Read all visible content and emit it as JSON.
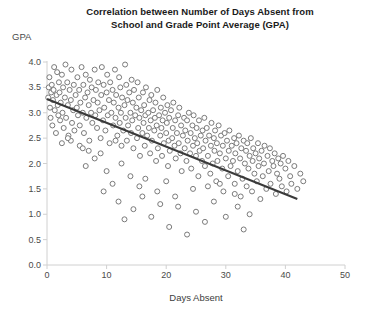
{
  "chart_data": {
    "type": "scatter",
    "title": "Correlation between Number of Days Absent from School and Grade Point Average (GPA)",
    "title_line1": "Correlation between Number of Days Absent from",
    "title_line2": "School and Grade Point Average (GPA)",
    "xlabel": "Days Absent",
    "ylabel": "GPA",
    "xlim": [
      0,
      50
    ],
    "ylim": [
      0.0,
      4.0
    ],
    "xticks": [
      0,
      10,
      20,
      30,
      40,
      50
    ],
    "xtick_labels": [
      "0",
      "10",
      "20",
      "30",
      "40",
      "50"
    ],
    "yticks": [
      0.0,
      0.5,
      1.0,
      1.5,
      2.0,
      2.5,
      3.0,
      3.5,
      4.0
    ],
    "ytick_labels": [
      "0.0",
      "0.5",
      "1.0",
      "1.5",
      "2.0",
      "2.5",
      "3.0",
      "3.5",
      "4.0"
    ],
    "grid": false,
    "legend": false,
    "marker": "open-circle",
    "marker_color": "#7a7a7a",
    "marker_fill": "#ffffff",
    "marker_size": 5,
    "trendline": {
      "label": "linear fit",
      "color": "#3a3a3a",
      "width": 2,
      "x_start": 0,
      "y_start": 3.27,
      "x_end": 42,
      "y_end": 1.3,
      "slope": -0.0469,
      "intercept": 3.27
    },
    "axis_color": "#d0d0d0",
    "points": [
      [
        0.2,
        3.3
      ],
      [
        0.3,
        3.5
      ],
      [
        0.4,
        3.7
      ],
      [
        0.5,
        3.1
      ],
      [
        0.6,
        2.9
      ],
      [
        0.7,
        3.4
      ],
      [
        0.8,
        3.55
      ],
      [
        0.9,
        2.75
      ],
      [
        1.0,
        3.25
      ],
      [
        1.1,
        3.45
      ],
      [
        1.2,
        3.9
      ],
      [
        1.3,
        3.05
      ],
      [
        1.5,
        2.6
      ],
      [
        1.6,
        3.35
      ],
      [
        1.7,
        3.8
      ],
      [
        1.8,
        3.15
      ],
      [
        1.9,
        2.95
      ],
      [
        2.0,
        3.6
      ],
      [
        2.1,
        3.4
      ],
      [
        2.2,
        2.85
      ],
      [
        2.3,
        3.2
      ],
      [
        2.5,
        3.75
      ],
      [
        2.6,
        3.0
      ],
      [
        2.7,
        3.5
      ],
      [
        2.8,
        2.7
      ],
      [
        3.0,
        3.3
      ],
      [
        3.1,
        3.95
      ],
      [
        3.2,
        2.9
      ],
      [
        3.4,
        3.6
      ],
      [
        3.5,
        3.15
      ],
      [
        3.6,
        2.55
      ],
      [
        3.8,
        3.45
      ],
      [
        4.0,
        3.25
      ],
      [
        4.1,
        3.85
      ],
      [
        4.2,
        2.8
      ],
      [
        4.4,
        3.05
      ],
      [
        4.5,
        3.55
      ],
      [
        4.6,
        2.65
      ],
      [
        4.8,
        3.35
      ],
      [
        5.0,
        3.1
      ],
      [
        5.1,
        3.7
      ],
      [
        5.2,
        2.95
      ],
      [
        5.4,
        3.45
      ],
      [
        5.5,
        2.75
      ],
      [
        5.6,
        3.2
      ],
      [
        5.8,
        3.9
      ],
      [
        6.0,
        3.0
      ],
      [
        6.1,
        3.55
      ],
      [
        6.2,
        2.6
      ],
      [
        6.4,
        3.3
      ],
      [
        6.5,
        3.75
      ],
      [
        6.6,
        2.9
      ],
      [
        6.8,
        3.4
      ],
      [
        7.0,
        3.15
      ],
      [
        7.1,
        2.45
      ],
      [
        7.2,
        3.65
      ],
      [
        7.4,
        3.0
      ],
      [
        7.5,
        3.5
      ],
      [
        7.6,
        2.8
      ],
      [
        7.8,
        3.25
      ],
      [
        8.0,
        3.85
      ],
      [
        8.1,
        2.95
      ],
      [
        8.2,
        3.45
      ],
      [
        8.4,
        2.7
      ],
      [
        8.5,
        3.2
      ],
      [
        8.6,
        3.6
      ],
      [
        8.8,
        3.05
      ],
      [
        9.0,
        2.5
      ],
      [
        9.1,
        3.35
      ],
      [
        9.2,
        3.9
      ],
      [
        9.4,
        2.85
      ],
      [
        9.5,
        3.55
      ],
      [
        9.6,
        3.1
      ],
      [
        9.8,
        2.65
      ],
      [
        10.0,
        3.4
      ],
      [
        10.1,
        3.75
      ],
      [
        10.2,
        2.95
      ],
      [
        10.4,
        3.25
      ],
      [
        10.5,
        2.4
      ],
      [
        10.6,
        3.6
      ],
      [
        10.8,
        3.0
      ],
      [
        11.0,
        3.45
      ],
      [
        11.1,
        2.75
      ],
      [
        11.2,
        3.2
      ],
      [
        11.4,
        3.85
      ],
      [
        11.5,
        2.9
      ],
      [
        11.6,
        3.35
      ],
      [
        11.8,
        2.55
      ],
      [
        12.0,
        3.1
      ],
      [
        12.1,
        3.7
      ],
      [
        12.2,
        2.8
      ],
      [
        12.3,
        3.5
      ],
      [
        12.4,
        3.0
      ],
      [
        12.5,
        2.35
      ],
      [
        12.6,
        3.3
      ],
      [
        12.8,
        2.65
      ],
      [
        13.0,
        3.15
      ],
      [
        13.1,
        3.95
      ],
      [
        13.2,
        2.9
      ],
      [
        13.3,
        3.55
      ],
      [
        13.4,
        2.45
      ],
      [
        13.5,
        3.25
      ],
      [
        13.6,
        2.75
      ],
      [
        13.8,
        3.4
      ],
      [
        14.0,
        3.0
      ],
      [
        14.1,
        2.6
      ],
      [
        14.2,
        3.65
      ],
      [
        14.3,
        2.85
      ],
      [
        14.4,
        3.2
      ],
      [
        14.5,
        2.3
      ],
      [
        14.6,
        3.45
      ],
      [
        14.8,
        2.95
      ],
      [
        15.0,
        3.1
      ],
      [
        15.1,
        2.5
      ],
      [
        15.2,
        3.6
      ],
      [
        15.3,
        2.7
      ],
      [
        15.4,
        3.3
      ],
      [
        15.5,
        2.9
      ],
      [
        15.6,
        2.15
      ],
      [
        15.8,
        3.05
      ],
      [
        16.0,
        2.6
      ],
      [
        16.1,
        3.4
      ],
      [
        16.2,
        2.8
      ],
      [
        16.3,
        3.15
      ],
      [
        16.4,
        2.35
      ],
      [
        16.5,
        2.95
      ],
      [
        16.6,
        3.5
      ],
      [
        16.8,
        2.55
      ],
      [
        17.0,
        3.0
      ],
      [
        17.1,
        2.7
      ],
      [
        17.2,
        3.25
      ],
      [
        17.3,
        2.2
      ],
      [
        17.4,
        2.85
      ],
      [
        17.5,
        3.35
      ],
      [
        17.6,
        2.45
      ],
      [
        17.8,
        3.05
      ],
      [
        18.0,
        2.65
      ],
      [
        18.1,
        2.9
      ],
      [
        18.2,
        3.2
      ],
      [
        18.3,
        2.05
      ],
      [
        18.4,
        2.75
      ],
      [
        18.5,
        3.45
      ],
      [
        18.6,
        2.3
      ],
      [
        18.8,
        2.95
      ],
      [
        19.0,
        2.55
      ],
      [
        19.1,
        3.1
      ],
      [
        19.2,
        2.7
      ],
      [
        19.3,
        2.15
      ],
      [
        19.4,
        2.85
      ],
      [
        19.5,
        3.3
      ],
      [
        19.6,
        2.4
      ],
      [
        19.8,
        3.0
      ],
      [
        20.0,
        2.6
      ],
      [
        20.1,
        2.8
      ],
      [
        20.2,
        3.15
      ],
      [
        20.3,
        1.95
      ],
      [
        20.4,
        2.45
      ],
      [
        20.5,
        2.9
      ],
      [
        20.6,
        2.25
      ],
      [
        20.8,
        3.05
      ],
      [
        21.0,
        2.5
      ],
      [
        21.1,
        2.7
      ],
      [
        21.2,
        3.2
      ],
      [
        21.4,
        2.35
      ],
      [
        21.5,
        2.85
      ],
      [
        21.6,
        2.1
      ],
      [
        21.8,
        2.6
      ],
      [
        22.0,
        2.95
      ],
      [
        22.1,
        2.4
      ],
      [
        22.2,
        3.1
      ],
      [
        22.4,
        2.2
      ],
      [
        22.5,
        2.75
      ],
      [
        22.6,
        1.85
      ],
      [
        22.8,
        2.55
      ],
      [
        23.0,
        2.9
      ],
      [
        23.1,
        2.3
      ],
      [
        23.2,
        2.65
      ],
      [
        23.4,
        2.05
      ],
      [
        23.5,
        2.85
      ],
      [
        23.6,
        2.45
      ],
      [
        23.8,
        3.0
      ],
      [
        24.0,
        2.2
      ],
      [
        24.1,
        2.6
      ],
      [
        24.2,
        1.9
      ],
      [
        24.4,
        2.75
      ],
      [
        24.5,
        2.35
      ],
      [
        24.6,
        2.95
      ],
      [
        24.8,
        2.5
      ],
      [
        25.0,
        2.15
      ],
      [
        25.1,
        2.7
      ],
      [
        25.2,
        2.4
      ],
      [
        25.4,
        1.75
      ],
      [
        25.5,
        2.85
      ],
      [
        25.6,
        2.25
      ],
      [
        25.8,
        2.55
      ],
      [
        26.0,
        2.05
      ],
      [
        26.1,
        2.65
      ],
      [
        26.2,
        2.3
      ],
      [
        26.4,
        2.9
      ],
      [
        26.5,
        1.95
      ],
      [
        26.6,
        2.45
      ],
      [
        26.8,
        2.7
      ],
      [
        27.0,
        2.15
      ],
      [
        27.2,
        2.55
      ],
      [
        27.4,
        1.8
      ],
      [
        27.5,
        2.35
      ],
      [
        27.6,
        2.8
      ],
      [
        27.8,
        2.0
      ],
      [
        28.0,
        2.5
      ],
      [
        28.1,
        2.25
      ],
      [
        28.2,
        2.65
      ],
      [
        28.4,
        1.65
      ],
      [
        28.5,
        2.4
      ],
      [
        28.6,
        2.05
      ],
      [
        28.8,
        2.75
      ],
      [
        29.0,
        2.2
      ],
      [
        29.2,
        2.55
      ],
      [
        29.4,
        1.9
      ],
      [
        29.5,
        2.35
      ],
      [
        29.6,
        1.45
      ],
      [
        29.8,
        2.6
      ],
      [
        30.0,
        2.1
      ],
      [
        30.2,
        2.45
      ],
      [
        30.4,
        1.75
      ],
      [
        30.5,
        2.25
      ],
      [
        30.6,
        2.65
      ],
      [
        30.8,
        1.95
      ],
      [
        31.0,
        2.35
      ],
      [
        31.2,
        2.05
      ],
      [
        31.4,
        2.5
      ],
      [
        31.5,
        1.6
      ],
      [
        31.6,
        2.2
      ],
      [
        31.8,
        2.4
      ],
      [
        32.0,
        1.85
      ],
      [
        32.2,
        2.55
      ],
      [
        32.4,
        2.1
      ],
      [
        32.5,
        1.35
      ],
      [
        32.6,
        2.3
      ],
      [
        32.8,
        1.7
      ],
      [
        33.0,
        2.45
      ],
      [
        33.2,
        2.0
      ],
      [
        33.4,
        2.25
      ],
      [
        33.5,
        1.55
      ],
      [
        33.6,
        2.4
      ],
      [
        33.8,
        1.9
      ],
      [
        34.0,
        2.15
      ],
      [
        34.2,
        2.5
      ],
      [
        34.4,
        1.45
      ],
      [
        34.5,
        2.05
      ],
      [
        34.6,
        2.3
      ],
      [
        34.8,
        1.8
      ],
      [
        35.0,
        2.2
      ],
      [
        35.2,
        1.65
      ],
      [
        35.4,
        2.4
      ],
      [
        35.5,
        1.95
      ],
      [
        35.6,
        2.1
      ],
      [
        35.8,
        1.3
      ],
      [
        36.0,
        2.25
      ],
      [
        36.2,
        1.75
      ],
      [
        36.4,
        2.0
      ],
      [
        36.5,
        2.35
      ],
      [
        36.8,
        1.5
      ],
      [
        37.0,
        2.15
      ],
      [
        37.2,
        1.85
      ],
      [
        37.4,
        2.3
      ],
      [
        37.5,
        1.6
      ],
      [
        37.8,
        2.05
      ],
      [
        38.0,
        1.95
      ],
      [
        38.2,
        2.2
      ],
      [
        38.4,
        1.4
      ],
      [
        38.6,
        1.8
      ],
      [
        38.8,
        2.1
      ],
      [
        39.0,
        1.7
      ],
      [
        39.2,
        2.0
      ],
      [
        39.4,
        1.55
      ],
      [
        39.6,
        2.15
      ],
      [
        40.0,
        1.9
      ],
      [
        40.2,
        1.45
      ],
      [
        40.5,
        2.05
      ],
      [
        40.8,
        1.75
      ],
      [
        41.0,
        1.6
      ],
      [
        41.5,
        1.95
      ],
      [
        42.0,
        1.5
      ],
      [
        42.5,
        1.8
      ],
      [
        43.0,
        1.65
      ],
      [
        12.0,
        1.25
      ],
      [
        14.5,
        1.1
      ],
      [
        16.0,
        1.35
      ],
      [
        17.5,
        0.95
      ],
      [
        19.0,
        1.2
      ],
      [
        20.5,
        0.75
      ],
      [
        22.0,
        1.15
      ],
      [
        23.5,
        0.6
      ],
      [
        25.0,
        1.05
      ],
      [
        26.5,
        0.85
      ],
      [
        28.0,
        1.25
      ],
      [
        30.0,
        0.95
      ],
      [
        31.5,
        1.4
      ],
      [
        33.0,
        0.7
      ],
      [
        9.5,
        1.45
      ],
      [
        11.0,
        1.6
      ],
      [
        13.0,
        0.9
      ],
      [
        15.5,
        1.55
      ],
      [
        18.5,
        1.45
      ],
      [
        21.5,
        1.35
      ],
      [
        24.5,
        1.5
      ],
      [
        27.0,
        1.55
      ],
      [
        29.0,
        1.6
      ],
      [
        32.0,
        1.15
      ],
      [
        34.0,
        1.0
      ],
      [
        6.5,
        1.95
      ],
      [
        8.0,
        2.1
      ],
      [
        10.0,
        1.85
      ],
      [
        12.5,
        2.0
      ],
      [
        7.0,
        2.25
      ],
      [
        5.5,
        2.35
      ],
      [
        9.0,
        2.2
      ],
      [
        11.5,
        2.45
      ],
      [
        4.0,
        2.45
      ],
      [
        6.0,
        2.3
      ],
      [
        14.0,
        1.75
      ],
      [
        16.5,
        1.7
      ],
      [
        20.0,
        1.65
      ],
      [
        2.5,
        2.4
      ],
      [
        3.5,
        2.5
      ]
    ]
  }
}
